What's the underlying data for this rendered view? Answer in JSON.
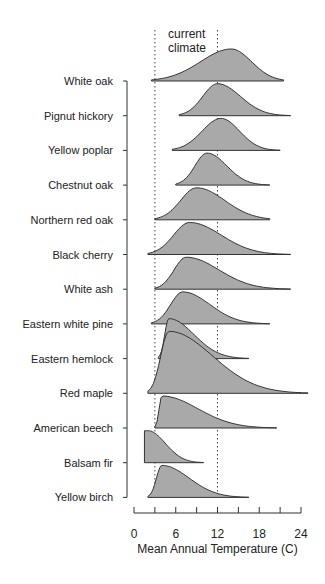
{
  "chart_data": {
    "type": "ridgeline",
    "title": "",
    "xlabel": "Mean Annual Temperature (C)",
    "ylabel": "",
    "xlim": [
      0,
      24
    ],
    "xticks": [
      0,
      3,
      6,
      9,
      12,
      15,
      18,
      21,
      24
    ],
    "xtick_labels": [
      "0",
      "6",
      "12",
      "18",
      "24"
    ],
    "grid": false,
    "annotation": "current climate",
    "reference_lines": [
      3,
      12
    ],
    "fill_color": "#a9a9a9",
    "series": [
      {
        "name": "White oak",
        "min": 2.5,
        "max": 21.5,
        "peak": 14,
        "shape": "symmetric"
      },
      {
        "name": "Pignut hickory",
        "min": 6.5,
        "max": 22.5,
        "peak": 12,
        "shape": "right-skew"
      },
      {
        "name": "Yellow poplar",
        "min": 5.5,
        "max": 21,
        "peak": 12.5,
        "shape": "right-skew"
      },
      {
        "name": "Chestnut oak",
        "min": 6,
        "max": 19.5,
        "peak": 10.5,
        "shape": "right-skew"
      },
      {
        "name": "Northern red oak",
        "min": 3,
        "max": 19.5,
        "peak": 9,
        "shape": "symmetric"
      },
      {
        "name": "Black cherry",
        "min": 2,
        "max": 22.5,
        "peak": 8,
        "shape": "right-skew"
      },
      {
        "name": "White ash",
        "min": 3,
        "max": 22.5,
        "peak": 7.5,
        "shape": "right-skew"
      },
      {
        "name": "Eastern white pine",
        "min": 2.5,
        "max": 19.5,
        "peak": 7,
        "shape": "right-skew"
      },
      {
        "name": "Eastern hemlock",
        "min": 3.5,
        "max": 16.5,
        "peak": 5,
        "shape": "right-skew"
      },
      {
        "name": "Red maple",
        "min": 2,
        "max": 25,
        "peak": 5,
        "shape": "right-skew"
      },
      {
        "name": "American beech",
        "min": 3,
        "max": 20.5,
        "peak": 4,
        "shape": "right-skew"
      },
      {
        "name": "Balsam fir",
        "min": 1.5,
        "max": 10,
        "peak": 2,
        "shape": "truncated-left"
      },
      {
        "name": "Yellow birch",
        "min": 2,
        "max": 16.5,
        "peak": 4,
        "shape": "right-skew"
      }
    ]
  }
}
